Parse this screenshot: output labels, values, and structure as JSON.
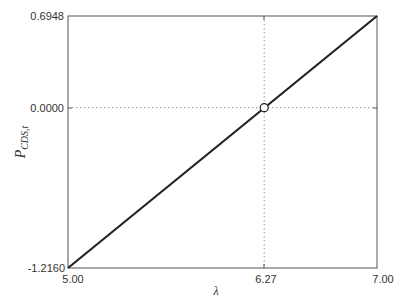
{
  "chart_data": {
    "type": "line",
    "title": "",
    "xlabel": "λ",
    "ylabel": "P",
    "ylabel_subscript": "CDS,t",
    "xlim": [
      5.0,
      7.0
    ],
    "ylim": [
      -1.216,
      0.6948
    ],
    "x_ticks": [
      5.0,
      6.27,
      7.0
    ],
    "x_tick_labels": [
      "5.00",
      "6.27",
      "7.00"
    ],
    "y_ticks": [
      -1.216,
      0.0,
      0.6948
    ],
    "y_tick_labels": [
      "-1.2160",
      "0.0000",
      "0.6948"
    ],
    "grid": false,
    "reference_lines": [
      {
        "orientation": "vertical",
        "value": 6.27,
        "style": "dotted"
      },
      {
        "orientation": "horizontal",
        "value": 0.0,
        "style": "dotted"
      }
    ],
    "series": [
      {
        "name": "P_CDS,t",
        "x": [
          5.0,
          7.0
        ],
        "y": [
          -1.216,
          0.6948
        ],
        "color": "#222222",
        "style": "solid"
      }
    ],
    "markers": [
      {
        "x": 6.27,
        "y": 0.0,
        "shape": "open-circle"
      }
    ],
    "legend": null
  },
  "colors": {
    "line": "#222222",
    "frame": "#555555",
    "reference": "#999999",
    "text": "#333333"
  }
}
